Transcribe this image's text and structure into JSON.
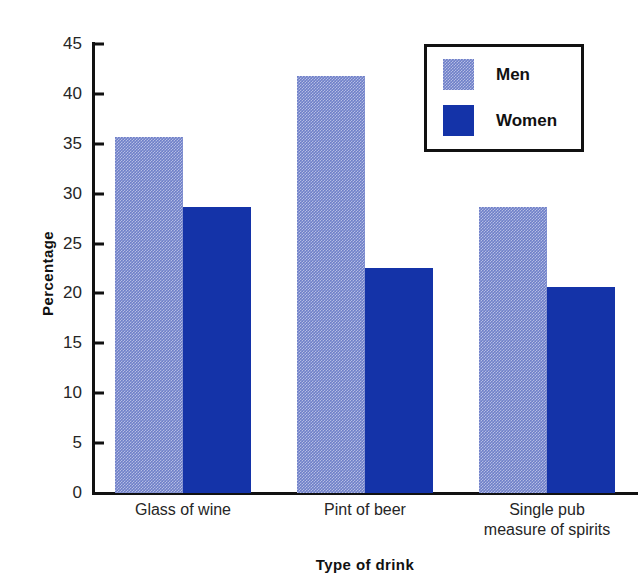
{
  "chart_data": {
    "type": "bar",
    "title": "",
    "subtitle": "",
    "xlabel": "Type of drink",
    "ylabel": "Percentage",
    "categories": [
      "Glass of wine",
      "Pint of beer",
      "Single pub measure of spirits"
    ],
    "series": [
      {
        "name": "Men",
        "values": [
          35.7,
          41.8,
          28.7
        ],
        "color": "#6e7fc8",
        "fill": "stippled"
      },
      {
        "name": "Women",
        "values": [
          28.7,
          22.6,
          20.6
        ],
        "color": "#1433a8",
        "fill": "solid"
      }
    ],
    "ylim": [
      0,
      45
    ],
    "ytick_values": [
      0,
      5,
      10,
      15,
      20,
      25,
      30,
      35,
      40,
      45
    ],
    "ytick_labels": [
      "0",
      "5",
      "10",
      "15",
      "20",
      "25",
      "30",
      "35",
      "40",
      "45"
    ],
    "grid": false,
    "legend": {
      "position": "top-right",
      "bordered": true,
      "entries": [
        "Men",
        "Women"
      ]
    },
    "axis_color": "#111111",
    "background_color": "#ffffff"
  },
  "axes": {
    "y_title": "Percentage",
    "x_title": "Type of drink"
  },
  "legend": {
    "items": [
      {
        "label": "Men"
      },
      {
        "label": "Women"
      }
    ]
  }
}
